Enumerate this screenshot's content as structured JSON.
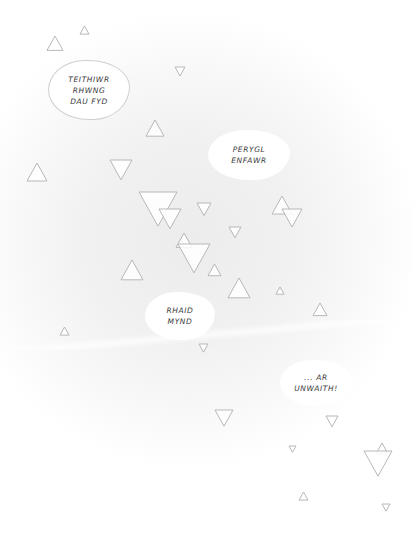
{
  "page": {
    "type": "comic-page",
    "background": "#ffffff",
    "glow_color": "#ececec",
    "triangle_stroke": "#b8b8b8"
  },
  "bubbles": [
    {
      "id": "bubble-teithiwr",
      "lines": [
        "TEITHIWR",
        "RHWNG",
        "DAU FYD"
      ],
      "x": 48,
      "y": 60,
      "w": 80,
      "h": 58,
      "outlined": true
    },
    {
      "id": "bubble-perygl",
      "lines": [
        "PERYGL",
        "ENFAWR"
      ],
      "x": 208,
      "y": 130,
      "w": 82,
      "h": 50,
      "outlined": false
    },
    {
      "id": "bubble-rhaid",
      "lines": [
        "RHAID",
        "MYND"
      ],
      "x": 145,
      "y": 292,
      "w": 70,
      "h": 48,
      "outlined": false
    },
    {
      "id": "bubble-ar-unwaith",
      "lines": [
        "... AR",
        "UNWAITH!"
      ],
      "x": 280,
      "y": 360,
      "w": 72,
      "h": 46,
      "outlined": false
    }
  ],
  "triangles": [
    {
      "x": 47,
      "y": 36,
      "s": 16,
      "dir": "up"
    },
    {
      "x": 80,
      "y": 26,
      "s": 9,
      "dir": "up"
    },
    {
      "x": 175,
      "y": 67,
      "s": 10,
      "dir": "down"
    },
    {
      "x": 146,
      "y": 120,
      "s": 18,
      "dir": "up"
    },
    {
      "x": 27,
      "y": 163,
      "s": 20,
      "dir": "up"
    },
    {
      "x": 110,
      "y": 160,
      "s": 22,
      "dir": "down"
    },
    {
      "x": 139,
      "y": 192,
      "s": 38,
      "dir": "down"
    },
    {
      "x": 159,
      "y": 209,
      "s": 22,
      "dir": "down"
    },
    {
      "x": 197,
      "y": 203,
      "s": 14,
      "dir": "down"
    },
    {
      "x": 229,
      "y": 227,
      "s": 12,
      "dir": "down"
    },
    {
      "x": 176,
      "y": 233,
      "s": 16,
      "dir": "up"
    },
    {
      "x": 178,
      "y": 244,
      "s": 32,
      "dir": "down"
    },
    {
      "x": 208,
      "y": 264,
      "s": 13,
      "dir": "up"
    },
    {
      "x": 121,
      "y": 260,
      "s": 22,
      "dir": "up"
    },
    {
      "x": 228,
      "y": 278,
      "s": 22,
      "dir": "up"
    },
    {
      "x": 272,
      "y": 196,
      "s": 20,
      "dir": "up"
    },
    {
      "x": 282,
      "y": 209,
      "s": 20,
      "dir": "down"
    },
    {
      "x": 276,
      "y": 287,
      "s": 8,
      "dir": "up"
    },
    {
      "x": 313,
      "y": 303,
      "s": 14,
      "dir": "up"
    },
    {
      "x": 60,
      "y": 327,
      "s": 9,
      "dir": "up"
    },
    {
      "x": 199,
      "y": 344,
      "s": 9,
      "dir": "down"
    },
    {
      "x": 215,
      "y": 410,
      "s": 18,
      "dir": "down"
    },
    {
      "x": 326,
      "y": 416,
      "s": 12,
      "dir": "down"
    },
    {
      "x": 289,
      "y": 446,
      "s": 7,
      "dir": "down"
    },
    {
      "x": 376,
      "y": 443,
      "s": 12,
      "dir": "up"
    },
    {
      "x": 364,
      "y": 451,
      "s": 28,
      "dir": "down"
    },
    {
      "x": 299,
      "y": 492,
      "s": 9,
      "dir": "up"
    },
    {
      "x": 382,
      "y": 504,
      "s": 8,
      "dir": "down"
    }
  ]
}
